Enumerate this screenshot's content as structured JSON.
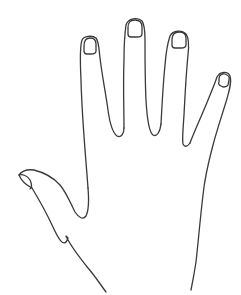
{
  "image": {
    "subject": "Line drawing of an open left hand with fingers spread",
    "stroke_color": "#3a3a3a",
    "background_color": "#ffffff"
  }
}
